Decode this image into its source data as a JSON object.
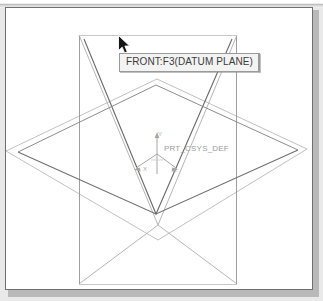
{
  "app": {
    "kind": "cad-3d-viewport",
    "background_color": "#ffffff",
    "frame_color": "#6f6f6f",
    "shadow_color": "#b9b9b9",
    "page_band_color": "#d9d9d9"
  },
  "viewport": {
    "name": "model-viewport",
    "geometry_color": "#b4b4b4",
    "highlight_color": "#4a4a4a"
  },
  "tooltip": {
    "text": "FRONT:F3(DATUM PLANE)",
    "background": "#f3f3f3",
    "border_color": "#9a9a9a",
    "text_color": "#3b3b3b"
  },
  "cursor": {
    "icon": "arrow-pointer",
    "fill": "#1a1a1a",
    "outline": "#ffffff"
  },
  "coordinate_system": {
    "label": "PRT_CSYS_DEF",
    "label_color": "#9d9d9d",
    "axes": [
      {
        "name": "y-axis",
        "label": "Y",
        "direction": "up"
      },
      {
        "name": "x-axis",
        "label": "X",
        "direction": "down-left"
      },
      {
        "name": "z-axis",
        "label": "Z",
        "direction": "down-right"
      }
    ]
  },
  "datum_planes": [
    {
      "name": "front-datum-plane",
      "shape": "vertical-rectangle",
      "selected": true,
      "outline_color": "#a9a9a9",
      "highlight_color": "#555555"
    },
    {
      "name": "top-datum-plane",
      "shape": "horizontal-diamond",
      "selected": false,
      "outline_color": "#bdbdbd"
    },
    {
      "name": "right-datum-plane",
      "shape": "vertical-bowtie",
      "selected": false,
      "outline_color": "#b0b0b0"
    }
  ]
}
